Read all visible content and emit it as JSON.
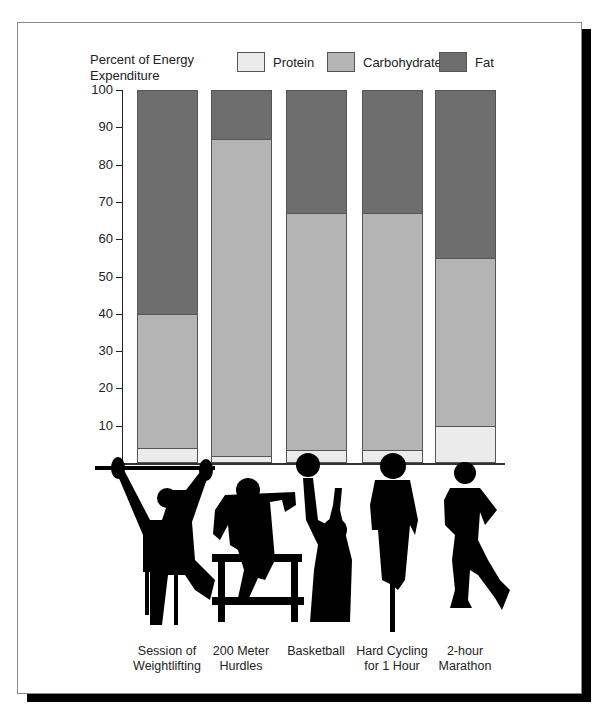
{
  "figure": {
    "y_axis_title_line1": "Percent of Energy",
    "y_axis_title_line2": "Expenditure",
    "legend": [
      {
        "label": "Protein",
        "color": "#ebebeb"
      },
      {
        "label": "Carbohydrate",
        "color": "#b4b4b4"
      },
      {
        "label": "Fat",
        "color": "#6e6e6e"
      }
    ],
    "y_ticks": [
      "100",
      "90",
      "80",
      "70",
      "60",
      "50",
      "40",
      "30",
      "20",
      "10"
    ],
    "categories": [
      {
        "line1": "Session of",
        "line2": "Weightlifting",
        "icon": "weightlifter-silhouette-icon"
      },
      {
        "line1": "200 Meter",
        "line2": "Hurdles",
        "icon": "hurdler-silhouette-icon"
      },
      {
        "line1": "Basketball",
        "line2": "",
        "icon": "basketball-player-silhouette-icon"
      },
      {
        "line1": "Hard Cycling",
        "line2": "for 1 Hour",
        "icon": "cyclist-silhouette-icon"
      },
      {
        "line1": "2-hour",
        "line2": "Marathon",
        "icon": "runner-silhouette-icon"
      }
    ]
  },
  "chart_data": {
    "type": "bar",
    "stacked": true,
    "title": "",
    "xlabel": "",
    "ylabel": "Percent of Energy Expenditure",
    "ylim": [
      0,
      100
    ],
    "yticks": [
      10,
      20,
      30,
      40,
      50,
      60,
      70,
      80,
      90,
      100
    ],
    "grid": false,
    "legend_position": "top",
    "categories": [
      "Session of Weightlifting",
      "200 Meter Hurdles",
      "Basketball",
      "Hard Cycling for 1 Hour",
      "2-hour Marathon"
    ],
    "series": [
      {
        "name": "Protein",
        "color": "#ebebeb",
        "values": [
          4,
          2,
          3.5,
          3.5,
          10
        ]
      },
      {
        "name": "Carbohydrate",
        "color": "#b4b4b4",
        "values": [
          36,
          85,
          63.5,
          63.5,
          45
        ]
      },
      {
        "name": "Fat",
        "color": "#6e6e6e",
        "values": [
          60,
          13,
          33,
          33,
          45
        ]
      }
    ]
  }
}
